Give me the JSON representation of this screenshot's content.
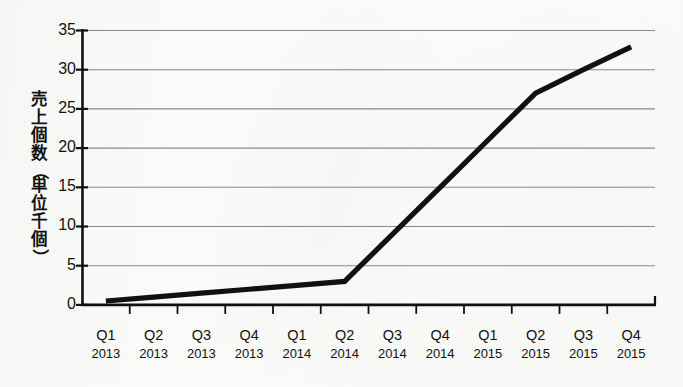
{
  "figure": {
    "background_color": "#fdfdfb",
    "ink_color": "#111111",
    "grid_color": "#8c8c8c",
    "series_color": "#111111"
  },
  "y_axis": {
    "title_text": "売上個数（単位千個）",
    "title_chars": [
      "売",
      "上",
      "個",
      "数",
      "（",
      "単",
      "位",
      "千",
      "個",
      "）"
    ],
    "ticks": [
      "35",
      "30",
      "25",
      "20",
      "15",
      "10",
      "5",
      "0"
    ],
    "min": 0,
    "max": 35,
    "step": 5
  },
  "x_axis": {
    "labels": [
      {
        "quarter": "Q1",
        "year": "2013"
      },
      {
        "quarter": "Q2",
        "year": "2013"
      },
      {
        "quarter": "Q3",
        "year": "2013"
      },
      {
        "quarter": "Q4",
        "year": "2013"
      },
      {
        "quarter": "Q1",
        "year": "2014"
      },
      {
        "quarter": "Q2",
        "year": "2014"
      },
      {
        "quarter": "Q3",
        "year": "2014"
      },
      {
        "quarter": "Q4",
        "year": "2014"
      },
      {
        "quarter": "Q1",
        "year": "2015"
      },
      {
        "quarter": "Q2",
        "year": "2015"
      },
      {
        "quarter": "Q3",
        "year": "2015"
      },
      {
        "quarter": "Q4",
        "year": "2015"
      }
    ]
  },
  "chart_data": {
    "type": "line",
    "title": "",
    "xlabel": "",
    "ylabel": "売上個数（単位千個）",
    "categories": [
      "Q1 2013",
      "Q2 2013",
      "Q3 2013",
      "Q4 2013",
      "Q1 2014",
      "Q2 2014",
      "Q3 2014",
      "Q4 2014",
      "Q1 2015",
      "Q2 2015",
      "Q3 2015",
      "Q4 2015"
    ],
    "values": [
      0.5,
      1.0,
      1.5,
      2.0,
      2.5,
      3.0,
      9.0,
      15.0,
      21.0,
      27.0,
      30.0,
      32.9
    ],
    "ylim": [
      0,
      35
    ],
    "ytick_values": [
      0,
      5,
      10,
      15,
      20,
      25,
      30,
      35
    ],
    "grid": "horizontal",
    "legend": "none",
    "series": [
      {
        "name": "売上個数",
        "values": [
          0.5,
          1.0,
          1.5,
          2.0,
          2.5,
          3.0,
          9.0,
          15.0,
          21.0,
          27.0,
          30.0,
          32.9
        ]
      }
    ],
    "annotations": [
      {
        "text": "inflection at Q2 2014",
        "x": "Q2 2014",
        "y": 3.0
      }
    ]
  }
}
